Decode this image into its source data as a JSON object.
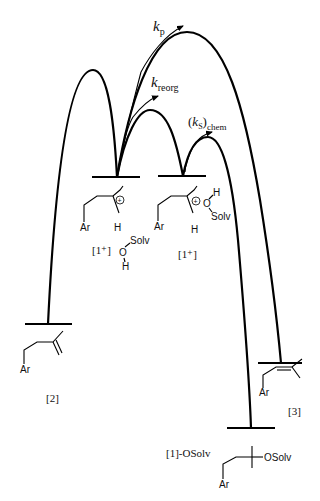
{
  "diagram": {
    "type": "energy-profile",
    "rates": {
      "kp": {
        "symbol": "k",
        "subscript": "p"
      },
      "kreorg": {
        "symbol": "k",
        "subscript": "reorg"
      },
      "ks_chem": {
        "open": "(",
        "symbol": "k",
        "subscript_inner": "S",
        "close": ")",
        "subscript": "chem"
      }
    },
    "species": {
      "ion_left": {
        "label": "[1⁺]",
        "atoms": {
          "ar": "Ar",
          "h": "H",
          "o": "O",
          "h2": "H",
          "solv": "Solv"
        }
      },
      "ion_right": {
        "label": "[1⁺]",
        "atoms": {
          "ar": "Ar",
          "h": "H",
          "o": "O",
          "h2": "H",
          "solv": "Solv"
        }
      },
      "alkene_2": {
        "label": "[2]",
        "atoms": {
          "ar": "Ar"
        }
      },
      "alkene_3": {
        "label": "[3]",
        "atoms": {
          "ar": "Ar"
        }
      },
      "ether": {
        "label": "[1]-OSolv",
        "atoms": {
          "ar": "Ar",
          "osolv": "OSolv"
        }
      }
    },
    "colors": {
      "line": "#000000",
      "background": "#ffffff"
    }
  }
}
